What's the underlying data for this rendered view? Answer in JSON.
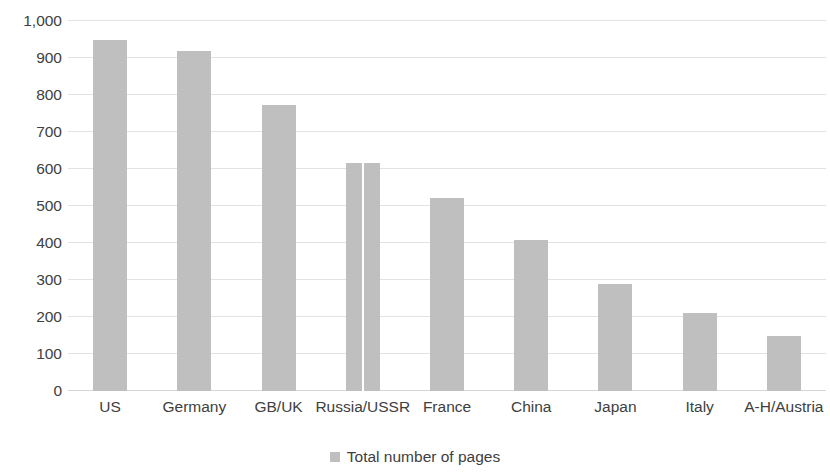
{
  "chart_data": {
    "type": "bar",
    "title": "",
    "subtitle": "",
    "xlabel": "",
    "ylabel": "",
    "categories": [
      "US",
      "Germany",
      "GB/UK",
      "Russia/USSR",
      "France",
      "China",
      "Japan",
      "Italy",
      "A-H/Austria"
    ],
    "series": [
      {
        "name": "Total number of pages",
        "values": [
          948,
          920,
          773,
          615,
          522,
          408,
          290,
          212,
          150
        ],
        "color": "#bfbfbf"
      }
    ],
    "ylim": [
      0,
      1000
    ],
    "y_ticks": [
      0,
      100,
      200,
      300,
      400,
      500,
      600,
      700,
      800,
      900,
      1000
    ],
    "y_tick_labels": [
      "0",
      "100",
      "200",
      "300",
      "400",
      "500",
      "600",
      "700",
      "800",
      "900",
      "1,000"
    ],
    "grid": true,
    "grid_axis": "y",
    "grid_color": "#e2e2e2",
    "legend": {
      "position": "bottom",
      "entries": [
        {
          "label": "Total number of pages",
          "color": "#bfbfbf"
        }
      ]
    },
    "notes": {
      "bar_split_category": "Russia/USSR",
      "bar_split_description": "thin white vertical line divides the Russia/USSR bar"
    }
  }
}
